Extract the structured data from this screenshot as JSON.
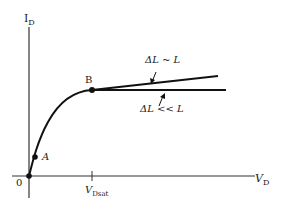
{
  "diagram": {
    "y_axis_label": "I",
    "y_axis_sub": "D",
    "x_axis_label": "V",
    "x_axis_sub": "D",
    "origin_label": "0",
    "point_a_label": "A",
    "point_b_label": "B",
    "vdsat_label": "V",
    "vdsat_sub": "Dsat",
    "upper_curve_label": "ΔL ~ L",
    "lower_curve_label": "ΔL << L",
    "caption_partial": "",
    "line_color": "#111111"
  }
}
